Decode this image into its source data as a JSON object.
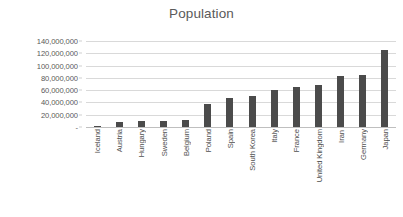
{
  "chart_data": {
    "type": "bar",
    "title": "Population",
    "xlabel": "",
    "ylabel": "",
    "grid": true,
    "legend": "none",
    "ylim": [
      0,
      140000000
    ],
    "ytick_step": 20000000,
    "ytick_labels": [
      "140,000,000",
      "120,000,000",
      "100,000,000",
      "80,000,000",
      "60,000,000",
      "40,000,000",
      "20,000,000",
      "-"
    ],
    "ytick_values": [
      140000000,
      120000000,
      100000000,
      80000000,
      60000000,
      40000000,
      20000000,
      0
    ],
    "categories": [
      "Iceland",
      "Austria",
      "Hungary",
      "Sweden",
      "Belgium",
      "Poland",
      "Spain",
      "South Korea",
      "Italy",
      "France",
      "United Kingdom",
      "Iran",
      "Germany",
      "Japan"
    ],
    "values": [
      340000,
      8800000,
      9800000,
      9900000,
      11400000,
      38000000,
      46500000,
      51000000,
      60000000,
      65000000,
      68000000,
      83000000,
      84000000,
      126000000
    ],
    "series_name": "Population",
    "bar_color": "#4b4b4b",
    "gridline_color": "#d9d9d9",
    "title_color": "#5a5a5a",
    "label_color": "#4f4f4f",
    "background_color": "#ffffff"
  }
}
